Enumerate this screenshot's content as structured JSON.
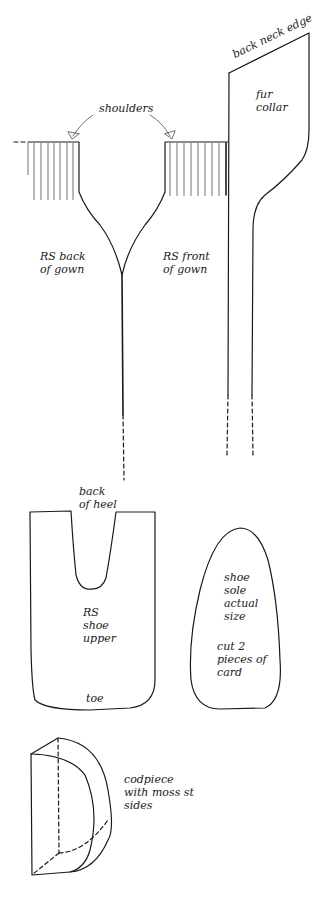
{
  "diagram": {
    "type": "knitting pattern schematic",
    "labels": {
      "back_neck_edge": "back neck edge",
      "fur_collar": "fur\ncollar",
      "shoulders": "shoulders",
      "rs_back_of_gown": "RS back\nof gown",
      "rs_front_of_gown": "RS front\nof gown",
      "back_of_heel": "back\nof heel",
      "rs_shoe_upper": "RS\nshoe\nupper",
      "toe": "toe",
      "shoe_sole": "shoe\nsole\nactual\nsize",
      "cut_instruction": "cut 2\npieces of\ncard",
      "codpiece": "codpiece\nwith moss st\nsides"
    },
    "colors": {
      "line": "#1a1a1a",
      "background": "#ffffff"
    }
  }
}
